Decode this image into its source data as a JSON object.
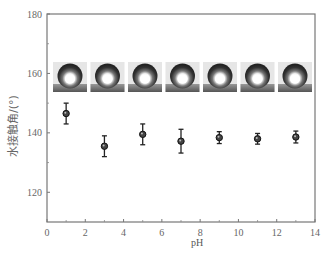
{
  "chart_data": {
    "type": "scatter",
    "title": "",
    "xlabel": "pH",
    "ylabel": "水接触角/(°)",
    "xlim": [
      0,
      14
    ],
    "ylim": [
      110,
      180
    ],
    "xticks": [
      0,
      2,
      4,
      6,
      8,
      10,
      12,
      14
    ],
    "yticks": [
      120,
      140,
      160,
      180
    ],
    "x_minor_ticks": [
      1,
      3,
      5,
      7,
      9,
      11,
      13
    ],
    "y_minor_ticks": [
      130,
      150,
      170
    ],
    "grid": false,
    "legend": null,
    "series": [
      {
        "name": "water contact angle",
        "marker": "circle",
        "x": [
          1,
          3,
          5,
          7,
          9,
          11,
          13
        ],
        "y": [
          146.5,
          135.5,
          139.5,
          137.2,
          138.4,
          138.0,
          138.6
        ],
        "error": [
          3.5,
          3.5,
          3.5,
          4.0,
          2.0,
          1.8,
          2.0
        ]
      }
    ],
    "annotations": {
      "droplet_images_count": 7,
      "droplet_images_y": 160,
      "description": "Inset photographs of water droplets on surface at each pH"
    }
  },
  "axis": {
    "xlabel": "pH",
    "ylabel": "水接触角/(°)"
  }
}
